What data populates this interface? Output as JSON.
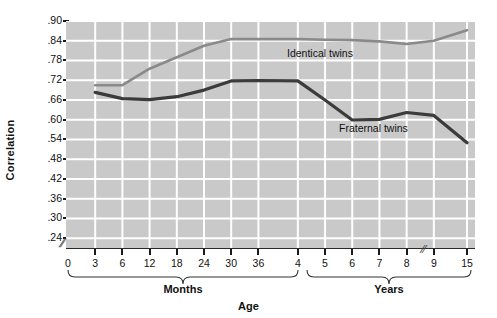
{
  "chart_data": {
    "type": "line",
    "title": "",
    "xlabel": "Age",
    "ylabel": "Correlation",
    "grid": true,
    "legend_position": "inline-annotation",
    "ylim": [
      0.21,
      0.9
    ],
    "yticks": [
      ".24",
      ".30",
      ".36",
      ".42",
      ".48",
      ".54",
      ".60",
      ".66",
      ".72",
      ".78",
      ".84",
      ".90"
    ],
    "ytick_values": [
      0.24,
      0.3,
      0.36,
      0.42,
      0.48,
      0.54,
      0.6,
      0.66,
      0.72,
      0.78,
      0.84,
      0.9
    ],
    "x_axis_note": "Axis is broken: months 0-36 then years 4-15, with a break between 9 and 15",
    "xticks": [
      "0",
      "3",
      "6",
      "12",
      "18",
      "24",
      "30",
      "36",
      "4",
      "5",
      "6",
      "7",
      "8",
      "9",
      "15"
    ],
    "x_groups": [
      {
        "label": "Months",
        "ticks": [
          "0",
          "3",
          "6",
          "12",
          "18",
          "24",
          "30",
          "36"
        ]
      },
      {
        "label": "Years",
        "ticks": [
          "4",
          "5",
          "6",
          "7",
          "8",
          "9",
          "15"
        ]
      }
    ],
    "categories": [
      "0",
      "3",
      "6",
      "12",
      "18",
      "24",
      "30",
      "36",
      "4",
      "5",
      "6",
      "7",
      "8",
      "9",
      "15"
    ],
    "series": [
      {
        "name": "Identical twins",
        "color": "#8a8a8a",
        "values": [
          null,
          0.705,
          0.705,
          0.755,
          0.79,
          0.825,
          0.845,
          0.845,
          0.845,
          0.843,
          0.842,
          0.838,
          0.83,
          0.84,
          0.872
        ]
      },
      {
        "name": "Fraternal twins",
        "color": "#3b3b3b",
        "values": [
          null,
          0.683,
          0.664,
          0.661,
          0.67,
          0.69,
          0.718,
          0.719,
          0.718,
          0.66,
          0.599,
          0.601,
          0.622,
          0.613,
          0.53
        ]
      }
    ],
    "annotations": [
      {
        "text": "Identical twins",
        "series": "Identical twins"
      },
      {
        "text": "Fraternal twins",
        "series": "Fraternal twins"
      }
    ],
    "colors": {
      "plot_background": "#c9c9c9",
      "gridline": "#ffffff",
      "axis": "#1a1a1a",
      "identical_twins": "#8a8a8a",
      "fraternal_twins": "#3b3b3b",
      "text": "#111111"
    }
  }
}
